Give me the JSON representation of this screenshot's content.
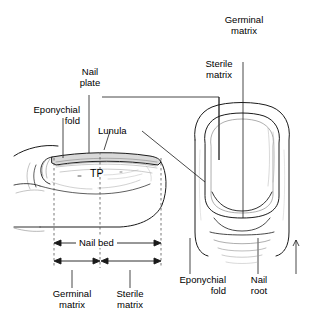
{
  "figure": {
    "background_color": "#ffffff",
    "line_color": "#1a1a1a",
    "nail_plate_fill": "#d9d9d9",
    "dash_color": "#555555"
  },
  "labels": {
    "nail_plate": "Nail\nplate",
    "eponychial_fold_left": "Eponychial\nfold",
    "lunula": "Lunula",
    "tp": "TP",
    "germinal_matrix_right": "Germinal\nmatrix",
    "sterile_matrix_right": "Sterile\nmatrix",
    "nail_bed": "Nail bed",
    "germinal_matrix_bottom": "Germinal\nmatrix",
    "sterile_matrix_bottom": "Sterile\nmatrix",
    "eponychial_fold_bottom": "Eponychial\nfold",
    "nail_root": "Nail\nroot"
  },
  "panels": {
    "left": {
      "name": "lateral-sagittal-view",
      "description": "Side profile of fingertip showing nail plate, nail bed and matrix zones"
    },
    "right": {
      "name": "dorsal-view",
      "description": "Top-down view of fingernail showing germinal and sterile matrix"
    }
  },
  "dimensions": {
    "nail_bed_span": "Nail bed",
    "segments": [
      "Germinal matrix",
      "Sterile matrix"
    ]
  }
}
